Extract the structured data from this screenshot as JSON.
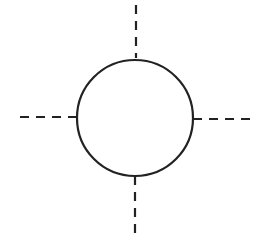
{
  "diagram": {
    "stroke_color": "#222222",
    "background": "#ffffff",
    "circle": {
      "cx": 135,
      "cy": 118,
      "r": 58
    },
    "lines": [
      {
        "id": "top",
        "x1": 136,
        "y1": 5,
        "x2": 136,
        "y2": 58
      },
      {
        "id": "left",
        "x1": 20,
        "y1": 117,
        "x2": 77,
        "y2": 117
      },
      {
        "id": "right",
        "x1": 193,
        "y1": 119,
        "x2": 253,
        "y2": 119
      },
      {
        "id": "bottom",
        "x1": 135,
        "y1": 176,
        "x2": 135,
        "y2": 237
      }
    ]
  }
}
